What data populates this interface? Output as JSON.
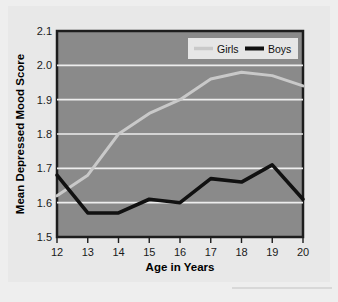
{
  "chart_data": {
    "type": "line",
    "title": "",
    "xlabel": "Age in Years",
    "ylabel": "Mean Depressed Mood Score",
    "xlim": [
      12,
      20
    ],
    "ylim": [
      1.5,
      2.1
    ],
    "grid": true,
    "legend_position": "top-right",
    "x": [
      12,
      13,
      14,
      15,
      16,
      17,
      18,
      19,
      20
    ],
    "xticklabels": [
      "12",
      "13",
      "14",
      "15",
      "16",
      "17",
      "18",
      "19",
      "20"
    ],
    "yticks": [
      1.5,
      1.6,
      1.7,
      1.8,
      1.9,
      2.0,
      2.1
    ],
    "yticklabels": [
      "1.5",
      "1.6",
      "1.7",
      "1.8",
      "1.9",
      "2.0",
      "2.1"
    ],
    "series": [
      {
        "name": "Girls",
        "color": "#c9c9c9",
        "values": [
          1.62,
          1.68,
          1.8,
          1.86,
          1.9,
          1.96,
          1.98,
          1.97,
          1.94
        ]
      },
      {
        "name": "Boys",
        "color": "#111111",
        "values": [
          1.68,
          1.57,
          1.57,
          1.61,
          1.6,
          1.67,
          1.66,
          1.71,
          1.61
        ]
      }
    ]
  },
  "legend": {
    "items": [
      {
        "label": "Girls",
        "color": "#c9c9c9"
      },
      {
        "label": "Boys",
        "color": "#111111"
      }
    ]
  },
  "axes": {
    "x_title": "Age in Years",
    "y_title": "Mean Depressed Mood Score"
  },
  "colors": {
    "page_background": "#eeeeee",
    "paper_background": "#e8e8e8",
    "plot_background": "#8a8a8a",
    "plot_border": "#1d1d1d",
    "gridline": "#ededed",
    "legend_background": "#e6e6e6",
    "girls": "#c9c9c9",
    "boys": "#111111",
    "text": "#151515"
  }
}
